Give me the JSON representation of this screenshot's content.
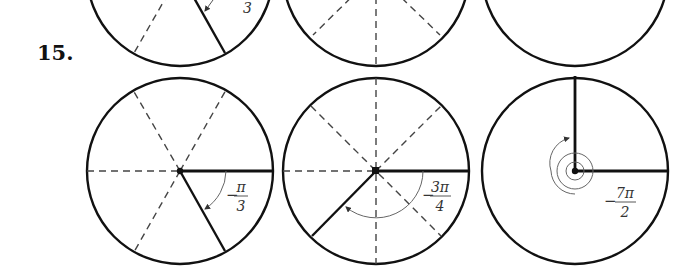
{
  "problem": {
    "number": "15."
  },
  "top_row_partial": {
    "visible_label_fragment": "3"
  },
  "figures": [
    {
      "id": "fig-a",
      "angle_label": {
        "sign": "−",
        "numerator": "π",
        "denominator": "3"
      },
      "angle_radians": "-π/3",
      "guides": "sixths"
    },
    {
      "id": "fig-b",
      "angle_label": {
        "sign": "−",
        "numerator": "3π",
        "denominator": "4"
      },
      "angle_radians": "-3π/4",
      "guides": "eighths"
    },
    {
      "id": "fig-c",
      "angle_label": {
        "sign": "−",
        "numerator": "7π",
        "denominator": "2"
      },
      "angle_radians": "-7π/2",
      "guides": "none"
    }
  ],
  "colors": {
    "stroke": "#111111",
    "dash": "#444444",
    "arc": "#666666"
  }
}
